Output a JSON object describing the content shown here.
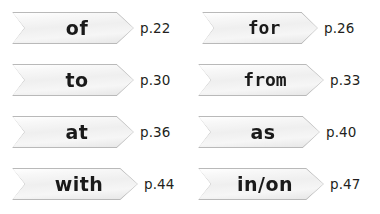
{
  "background_color": "#ffffff",
  "banner": {
    "fill_top_color": "#ffffff",
    "fill_bottom_color": "#e4e4e4",
    "border_color": "#b9b9b9",
    "text_color": "#1a1a1a"
  },
  "page_number_color": "#231f20",
  "columns": [
    {
      "name": "left-column",
      "entries": [
        {
          "word": "of",
          "page": "p.22",
          "style": "rounded"
        },
        {
          "word": "to",
          "page": "p.30",
          "style": "rounded"
        },
        {
          "word": "at",
          "page": "p.36",
          "style": "rounded"
        },
        {
          "word": "with",
          "page": "p.44",
          "style": "rounded"
        }
      ]
    },
    {
      "name": "right-column",
      "entries": [
        {
          "word": "for",
          "page": "p.26",
          "style": "mono"
        },
        {
          "word": "from",
          "page": "p.33",
          "style": "mono"
        },
        {
          "word": "as",
          "page": "p.40",
          "style": "rounded"
        },
        {
          "word": "in/on",
          "page": "p.47",
          "style": "rounded"
        }
      ]
    }
  ]
}
